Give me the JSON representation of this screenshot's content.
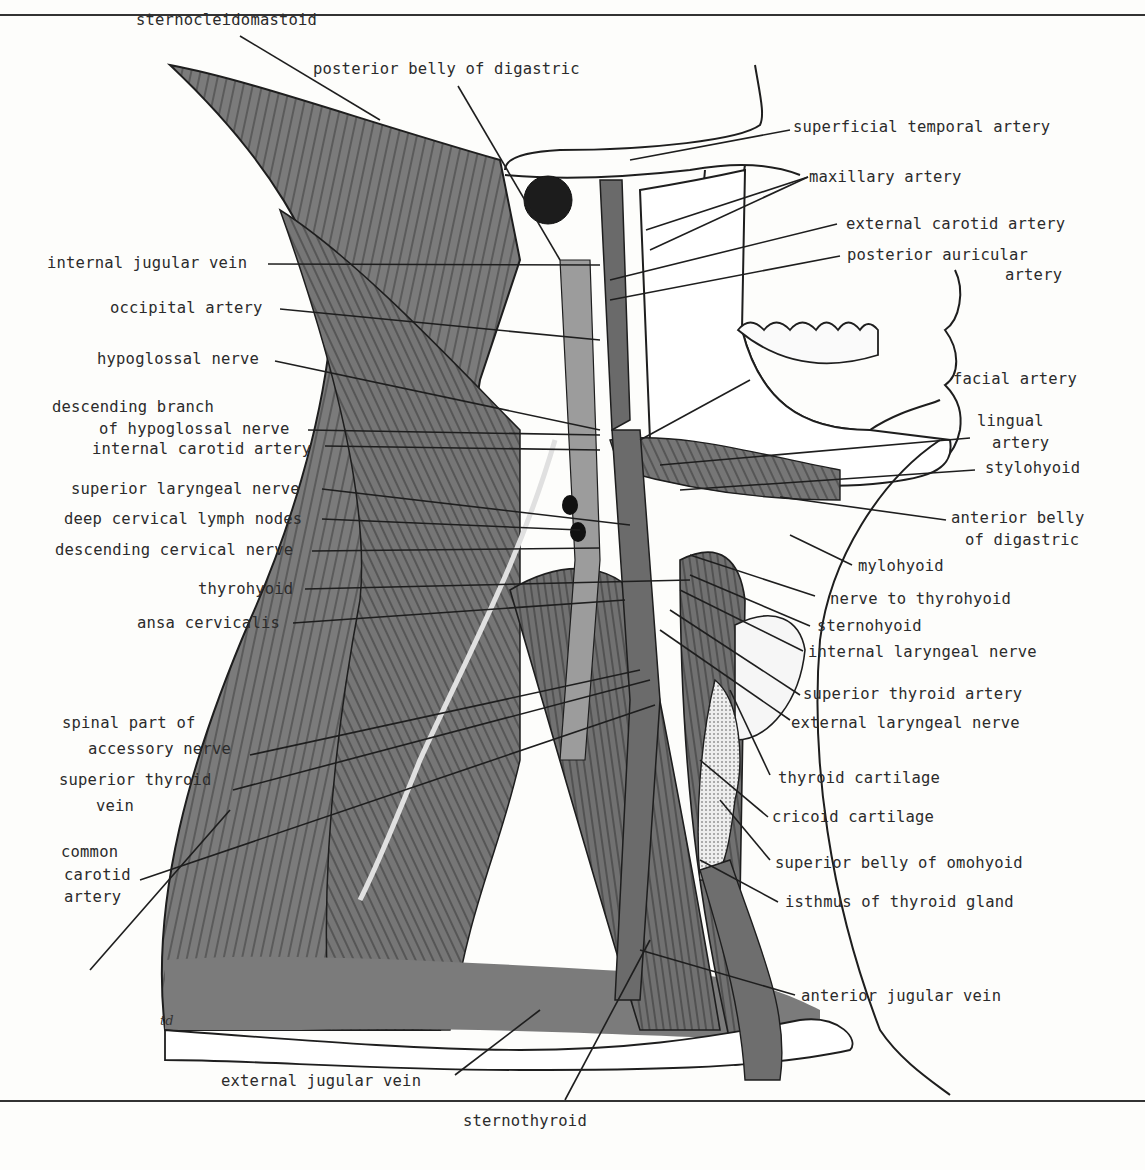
{
  "figure": {
    "type": "anatomical illustration",
    "artist_initials": "td",
    "colors": {
      "muscle": "#7a7a7a",
      "muscle_dark": "#5f5f5f",
      "line": "#1e1e1e",
      "background": "#fdfdfb",
      "bone": "#ffffff"
    }
  },
  "labels": {
    "sternocleidomastoid": "sternocleidomastoid",
    "posterior_belly_digastric": "posterior belly of digastric",
    "superficial_temporal_artery": "superficial temporal artery",
    "maxillary_artery": "maxillary artery",
    "external_carotid_artery": "external carotid artery",
    "posterior_auricular_artery_1": "posterior auricular",
    "posterior_auricular_artery_2": "artery",
    "internal_jugular_vein": "internal jugular vein",
    "occipital_artery": "occipital artery",
    "hypoglossal_nerve": "hypoglossal nerve",
    "descending_branch_1": "descending branch",
    "descending_branch_2": "of hypoglossal nerve",
    "internal_carotid_artery": "internal carotid artery",
    "facial_artery": "facial artery",
    "lingual_artery_1": "lingual",
    "lingual_artery_2": "artery",
    "stylohyoid": "stylohyoid",
    "superior_laryngeal_nerve": "superior laryngeal nerve",
    "deep_cervical_lymph_nodes": "deep cervical lymph nodes",
    "descending_cervical_nerve": "descending cervical nerve",
    "anterior_belly_digastric_1": "anterior belly",
    "anterior_belly_digastric_2": "of digastric",
    "mylohyoid": "mylohyoid",
    "thyrohyoid": "thyrohyoid",
    "nerve_to_thyrohyoid": "nerve to thyrohyoid",
    "ansa_cervicalis": "ansa cervicalis",
    "sternohyoid": "sternohyoid",
    "internal_laryngeal_nerve": "internal laryngeal nerve",
    "superior_thyroid_artery": "superior thyroid artery",
    "external_laryngeal_nerve": "external laryngeal nerve",
    "spinal_accessory_1": "spinal part of",
    "spinal_accessory_2": "accessory nerve",
    "thyroid_cartilage": "thyroid cartilage",
    "superior_thyroid_vein_1": "superior thyroid",
    "superior_thyroid_vein_2": "vein",
    "cricoid_cartilage": "cricoid cartilage",
    "common_carotid_1": "common",
    "common_carotid_2": "carotid",
    "common_carotid_3": "artery",
    "superior_belly_omohyoid": "superior belly of omohyoid",
    "isthmus_thyroid": "isthmus of thyroid gland",
    "anterior_jugular_vein": "anterior jugular vein",
    "external_jugular_vein": "external jugular vein",
    "sternothyroid": "sternothyroid"
  },
  "caption": "· · · · · · · ·"
}
